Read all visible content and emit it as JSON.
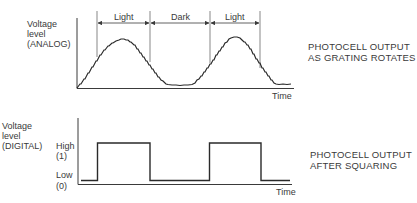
{
  "top_panel": {
    "y_label": [
      "Voltage",
      "level",
      "(ANALOG)"
    ],
    "x_label": "Time",
    "intervals": [
      {
        "label": "Light",
        "x_start": 97,
        "x_end": 150
      },
      {
        "label": "Dark",
        "x_start": 150,
        "x_end": 210
      },
      {
        "label": "Light",
        "x_start": 210,
        "x_end": 260
      }
    ],
    "caption": [
      "PHOTOCELL OUTPUT",
      "AS GRATING ROTATES"
    ]
  },
  "bottom_panel": {
    "y_label": [
      "Voltage",
      "level",
      "(DIGITAL)"
    ],
    "levels": {
      "high": [
        "High",
        "(1)"
      ],
      "low": [
        "Low",
        "(0)"
      ]
    },
    "x_label": "Time",
    "caption": [
      "PHOTOCELL OUTPUT",
      "AFTER SQUARING"
    ]
  },
  "colors": {
    "ink": "#3a3a3a",
    "background": "#ffffff"
  }
}
